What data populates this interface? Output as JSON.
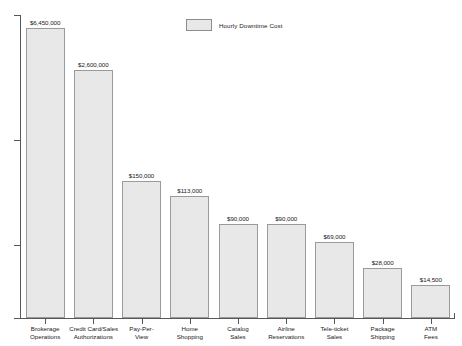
{
  "chart_data": {
    "type": "bar",
    "title": "",
    "subtitle": "",
    "xlabel": "",
    "ylabel": "",
    "grid": false,
    "legend_position": "top-center",
    "legend": [
      "Hourly Downtime Cost"
    ],
    "value_prefix": "$",
    "categories": [
      "Brokerage Operations",
      "Credit Card/Sales Authorizations",
      "Pay-Per-View",
      "Home Shopping",
      "Catalog Sales",
      "Airline Reservations",
      "Tele-ticket Sales",
      "Package Shipping",
      "ATM Fees"
    ],
    "category_lines": [
      [
        "Brokerage",
        "Operations"
      ],
      [
        "Credit Card/Sales",
        "Authorizations"
      ],
      [
        "Pay-Per-",
        "View"
      ],
      [
        "Home",
        "Shopping"
      ],
      [
        "Catalog",
        "Sales"
      ],
      [
        "Airline",
        "Reservations"
      ],
      [
        "Tele-ticket",
        "Sales"
      ],
      [
        "Package",
        "Shipping"
      ],
      [
        "ATM",
        "Fees"
      ]
    ],
    "values": [
      6450000,
      2600000,
      150000,
      113000,
      90000,
      90000,
      69000,
      28000,
      14500
    ],
    "value_labels": [
      "$6,450,000",
      "$2,600,000",
      "$150,000",
      "$113,000",
      "$90,000",
      "$90,000",
      "$69,000",
      "$28,000",
      "$14,500"
    ],
    "bar_pixel_heights": [
      290,
      248,
      137,
      122,
      94,
      94,
      76,
      50,
      33
    ],
    "axis_tick_pixel_positions": [
      15,
      140,
      245,
      318
    ],
    "colors": {
      "bar_fill": "#e8e8e8",
      "bar_border": "#9a9a9a",
      "axis": "#55585a",
      "text": "#1a1a1a",
      "background": "#ffffff"
    }
  }
}
